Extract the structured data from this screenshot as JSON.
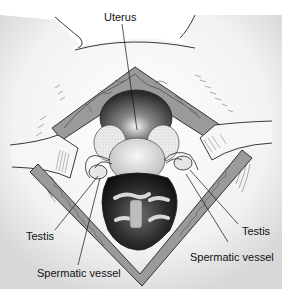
{
  "figure": {
    "labels": {
      "uterus": "Uterus",
      "testis_left": "Testis",
      "testis_right": "Testis",
      "spermatic_vessel_left": "Spermatic vessel",
      "spermatic_vessel_right": "Spermatic vessel"
    }
  }
}
